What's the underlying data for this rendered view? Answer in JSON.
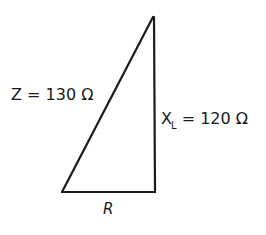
{
  "diagram": {
    "type": "impedance-triangle",
    "vertices": {
      "top": [
        153,
        17
      ],
      "bottom_left": [
        62,
        192
      ],
      "bottom_right": [
        155,
        192
      ]
    },
    "stroke_color": "#1a1a1a",
    "labels": {
      "hypotenuse": {
        "symbol": "Z",
        "equals": " = ",
        "value": "130",
        "unit": " Ω"
      },
      "vertical_side": {
        "symbol": "X",
        "subscript": "L",
        "equals": " = ",
        "value": "120",
        "unit": " Ω"
      },
      "base": {
        "symbol": "R"
      }
    }
  }
}
